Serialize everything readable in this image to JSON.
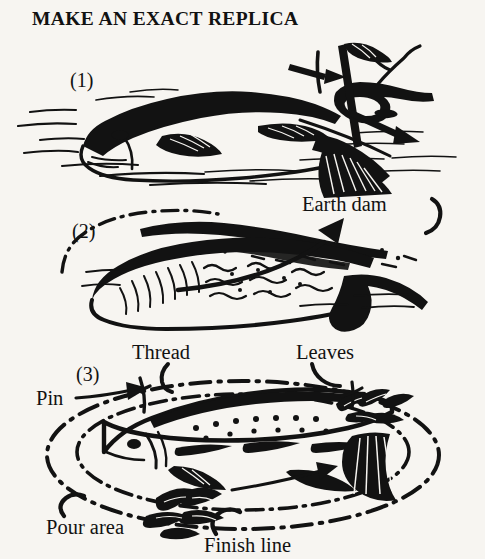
{
  "page": {
    "title": "MAKE AN EXACT REPLICA",
    "background_color": "#f7f5f1",
    "ink_color": "#121212",
    "width": 485,
    "height": 559
  },
  "steps": [
    {
      "number": "(1)",
      "caption": ""
    },
    {
      "number": "(2)",
      "caption": ""
    },
    {
      "number": "(3)",
      "caption": ""
    }
  ],
  "labels": {
    "earth_dam": "Earth dam",
    "thread": "Thread",
    "leaves": "Leaves",
    "pin": "Pin",
    "pour_area": "Pour area",
    "finish_line": "Finish line"
  },
  "figure": {
    "type": "line-art-instructional-diagram",
    "panel1": {
      "subject": "fish lying on ground with hand holding a pointed stick tracing around it",
      "arrows": 2,
      "ground_hatching": true
    },
    "panel2": {
      "subject": "hollow fish-shaped impression in earth",
      "arrow_points_to": "Earth dam",
      "dash_dot_outline": true
    },
    "panel3": {
      "subject": "spotted trout replica inside thread ring with leaves and pins",
      "dash_dot_rings": 2,
      "has_pour_area": true,
      "has_finish_line": true
    }
  }
}
